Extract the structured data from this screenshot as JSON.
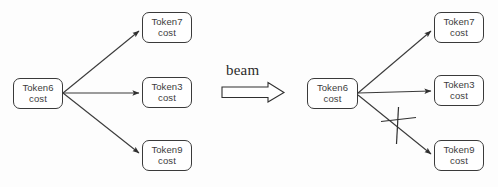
{
  "figure": {
    "background_color": "#fdfdfd",
    "stroke_color": "#3a3a3a",
    "text_color": "#3c3c3c"
  },
  "transition": {
    "label": "beam",
    "arrow_name": "block-arrow-right"
  },
  "left_graph": {
    "name": "before-beam-pruning",
    "root": {
      "line1": "Token6",
      "line2": "cost"
    },
    "children": [
      {
        "line1": "Token7",
        "line2": "cost",
        "pruned": false
      },
      {
        "line1": "Token3",
        "line2": "cost",
        "pruned": false
      },
      {
        "line1": "Token9",
        "line2": "cost",
        "pruned": false
      }
    ]
  },
  "right_graph": {
    "name": "after-beam-pruning",
    "root": {
      "line1": "Token6",
      "line2": "cost"
    },
    "children": [
      {
        "line1": "Token7",
        "line2": "cost",
        "pruned": false
      },
      {
        "line1": "Token3",
        "line2": "cost",
        "pruned": false
      },
      {
        "line1": "Token9",
        "line2": "cost",
        "pruned": true
      }
    ],
    "pruned_edge_marker": "cross-mark"
  }
}
